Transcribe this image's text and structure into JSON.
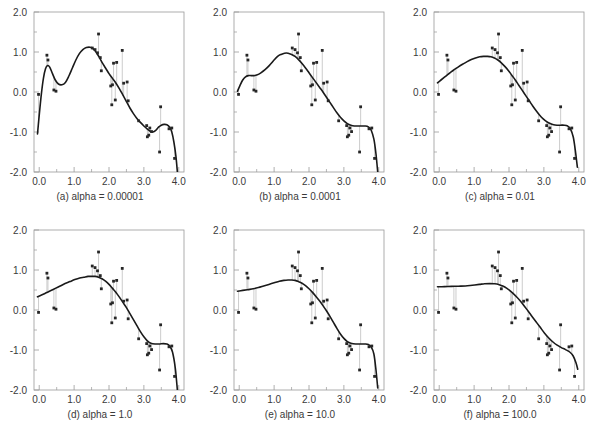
{
  "figure": {
    "type": "multi-panel-scatter-with-fitted-curve",
    "rows": 2,
    "cols": 3,
    "background": "#ffffff",
    "marker_color": "#262626",
    "curve_color": "#1a1a1a",
    "stem_color": "#bfbfbf",
    "axis_color": "#9a9a9a",
    "text_color": "#3a3a3a"
  },
  "axes": {
    "xlim": [
      -0.15,
      4.15
    ],
    "ylim": [
      -2.0,
      2.0
    ],
    "xticks": [
      0.0,
      1.0,
      2.0,
      3.0,
      4.0
    ],
    "xticklabels": [
      "0.0",
      "1.0",
      "2.0",
      "3.0",
      "4.0"
    ],
    "xminorticks": [
      0.5,
      1.5,
      2.5,
      3.5
    ],
    "yticks": [
      2.0,
      1.0,
      0.0,
      -1.0,
      -2.0
    ],
    "yticklabels": [
      "2.0",
      "1.0",
      "0.0",
      "-1.0",
      "-2.0"
    ],
    "yminorticks": [
      1.5,
      0.5,
      -0.5,
      -1.5
    ],
    "grid": false,
    "xlabel": "",
    "ylabel": ""
  },
  "chart_data": {
    "type": "scatter",
    "title": "",
    "xlabel": "",
    "ylabel": "",
    "xlim": [
      -0.15,
      4.15
    ],
    "ylim": [
      -2.0,
      2.0
    ],
    "grid": false,
    "legend": "none",
    "shared_scatter": {
      "name": "observations",
      "x": [
        -0.02,
        0.22,
        0.25,
        0.42,
        0.48,
        1.52,
        1.6,
        1.67,
        1.7,
        1.75,
        1.78,
        2.05,
        2.08,
        2.1,
        2.13,
        2.18,
        2.22,
        2.38,
        2.42,
        2.52,
        2.55,
        2.85,
        3.08,
        3.1,
        3.14,
        3.17,
        3.22,
        3.45,
        3.48,
        3.72,
        3.8,
        3.88
      ],
      "y": [
        -0.06,
        0.92,
        0.8,
        0.05,
        0.02,
        1.1,
        1.06,
        0.98,
        1.45,
        0.86,
        0.53,
        0.15,
        -0.32,
        0.18,
        0.72,
        -0.2,
        0.74,
        1.04,
        0.22,
        0.25,
        -0.22,
        -0.72,
        -0.84,
        -1.12,
        -1.08,
        -0.9,
        -0.99,
        -1.5,
        -0.37,
        -0.92,
        -0.9,
        -1.66
      ]
    },
    "panels": [
      {
        "id": "a",
        "label": "(a) alpha = 0.00001",
        "alpha": "0.00001",
        "series_name": "smoothing spline fit",
        "curve": {
          "x": [
            -0.05,
            0.0,
            0.06,
            0.12,
            0.18,
            0.24,
            0.3,
            0.38,
            0.46,
            0.55,
            0.65,
            0.75,
            0.85,
            0.95,
            1.05,
            1.15,
            1.25,
            1.35,
            1.45,
            1.52,
            1.6,
            1.7,
            1.8,
            1.9,
            2.0,
            2.1,
            2.2,
            2.3,
            2.4,
            2.5,
            2.6,
            2.7,
            2.8,
            2.9,
            3.0,
            3.1,
            3.18,
            3.26,
            3.34,
            3.42,
            3.5,
            3.58,
            3.66,
            3.74,
            3.8,
            3.86,
            3.92,
            3.96
          ],
          "y": [
            -1.05,
            -0.58,
            -0.06,
            0.34,
            0.58,
            0.66,
            0.62,
            0.46,
            0.3,
            0.2,
            0.18,
            0.24,
            0.4,
            0.6,
            0.8,
            0.96,
            1.06,
            1.11,
            1.12,
            1.1,
            1.03,
            0.9,
            0.74,
            0.6,
            0.46,
            0.34,
            0.22,
            0.08,
            -0.08,
            -0.24,
            -0.4,
            -0.54,
            -0.66,
            -0.76,
            -0.85,
            -0.93,
            -0.98,
            -1.0,
            -0.96,
            -0.88,
            -0.83,
            -0.81,
            -0.82,
            -0.88,
            -1.0,
            -1.25,
            -1.62,
            -2.0
          ]
        }
      },
      {
        "id": "b",
        "label": "(b) alpha = 0.0001",
        "alpha": "0.0001",
        "series_name": "smoothing spline fit",
        "curve": {
          "x": [
            -0.05,
            0.02,
            0.1,
            0.18,
            0.26,
            0.34,
            0.42,
            0.52,
            0.62,
            0.74,
            0.86,
            0.98,
            1.1,
            1.2,
            1.3,
            1.4,
            1.5,
            1.6,
            1.7,
            1.8,
            1.9,
            2.0,
            2.1,
            2.2,
            2.3,
            2.4,
            2.5,
            2.6,
            2.7,
            2.8,
            2.9,
            3.0,
            3.1,
            3.2,
            3.3,
            3.4,
            3.5,
            3.6,
            3.7,
            3.78,
            3.86,
            3.92,
            3.97
          ],
          "y": [
            0.02,
            0.16,
            0.3,
            0.38,
            0.41,
            0.41,
            0.41,
            0.43,
            0.48,
            0.56,
            0.66,
            0.78,
            0.89,
            0.94,
            0.97,
            0.97,
            0.94,
            0.89,
            0.81,
            0.71,
            0.6,
            0.48,
            0.36,
            0.24,
            0.12,
            0.0,
            -0.13,
            -0.26,
            -0.39,
            -0.52,
            -0.63,
            -0.72,
            -0.79,
            -0.83,
            -0.85,
            -0.85,
            -0.85,
            -0.85,
            -0.87,
            -0.95,
            -1.18,
            -1.55,
            -2.0
          ]
        }
      },
      {
        "id": "c",
        "label": "(c) alpha = 0.01",
        "alpha": "0.01",
        "series_name": "smoothing spline fit",
        "curve": {
          "x": [
            -0.05,
            0.05,
            0.15,
            0.25,
            0.35,
            0.45,
            0.55,
            0.68,
            0.8,
            0.92,
            1.04,
            1.16,
            1.28,
            1.38,
            1.48,
            1.58,
            1.68,
            1.78,
            1.88,
            1.98,
            2.08,
            2.18,
            2.28,
            2.38,
            2.48,
            2.58,
            2.68,
            2.78,
            2.88,
            2.98,
            3.08,
            3.18,
            3.28,
            3.38,
            3.48,
            3.58,
            3.68,
            3.76,
            3.84,
            3.9,
            3.96
          ],
          "y": [
            0.23,
            0.3,
            0.37,
            0.44,
            0.51,
            0.57,
            0.63,
            0.7,
            0.76,
            0.81,
            0.85,
            0.88,
            0.89,
            0.89,
            0.88,
            0.85,
            0.8,
            0.73,
            0.64,
            0.54,
            0.42,
            0.3,
            0.17,
            0.04,
            -0.09,
            -0.22,
            -0.35,
            -0.47,
            -0.58,
            -0.67,
            -0.74,
            -0.79,
            -0.82,
            -0.83,
            -0.83,
            -0.83,
            -0.85,
            -0.92,
            -1.12,
            -1.45,
            -1.88
          ]
        }
      },
      {
        "id": "d",
        "label": "(d) alpha = 1.0",
        "alpha": "1.0",
        "series_name": "smoothing spline fit",
        "curve": {
          "x": [
            -0.05,
            0.08,
            0.2,
            0.32,
            0.46,
            0.6,
            0.74,
            0.88,
            1.02,
            1.16,
            1.28,
            1.4,
            1.5,
            1.6,
            1.7,
            1.8,
            1.9,
            2.0,
            2.1,
            2.2,
            2.3,
            2.4,
            2.5,
            2.6,
            2.7,
            2.8,
            2.9,
            3.0,
            3.1,
            3.2,
            3.32,
            3.44,
            3.56,
            3.66,
            3.74,
            3.82,
            3.9,
            3.96
          ],
          "y": [
            0.33,
            0.38,
            0.43,
            0.48,
            0.54,
            0.6,
            0.66,
            0.71,
            0.76,
            0.8,
            0.82,
            0.84,
            0.84,
            0.84,
            0.82,
            0.78,
            0.72,
            0.64,
            0.54,
            0.44,
            0.32,
            0.19,
            0.06,
            -0.09,
            -0.24,
            -0.39,
            -0.54,
            -0.67,
            -0.77,
            -0.83,
            -0.85,
            -0.85,
            -0.84,
            -0.85,
            -0.9,
            -1.05,
            -1.45,
            -2.0
          ]
        }
      },
      {
        "id": "e",
        "label": "(e) alpha = 10.0",
        "alpha": "10.0",
        "series_name": "smoothing spline fit",
        "curve": {
          "x": [
            -0.05,
            0.1,
            0.25,
            0.4,
            0.55,
            0.7,
            0.85,
            1.0,
            1.15,
            1.28,
            1.4,
            1.5,
            1.6,
            1.7,
            1.8,
            1.9,
            2.0,
            2.1,
            2.2,
            2.3,
            2.4,
            2.5,
            2.6,
            2.7,
            2.8,
            2.9,
            3.0,
            3.1,
            3.2,
            3.34,
            3.48,
            3.6,
            3.7,
            3.78,
            3.86,
            3.92,
            3.97
          ],
          "y": [
            0.47,
            0.49,
            0.51,
            0.53,
            0.56,
            0.6,
            0.64,
            0.68,
            0.72,
            0.74,
            0.75,
            0.75,
            0.74,
            0.71,
            0.67,
            0.61,
            0.53,
            0.44,
            0.34,
            0.23,
            0.11,
            -0.02,
            -0.16,
            -0.31,
            -0.46,
            -0.6,
            -0.71,
            -0.79,
            -0.83,
            -0.85,
            -0.85,
            -0.85,
            -0.86,
            -0.92,
            -1.1,
            -1.5,
            -1.95
          ]
        }
      },
      {
        "id": "f",
        "label": "(f) alpha = 100.0",
        "alpha": "100.0",
        "series_name": "smoothing spline fit",
        "curve": {
          "x": [
            -0.05,
            0.15,
            0.35,
            0.55,
            0.75,
            0.95,
            1.15,
            1.3,
            1.45,
            1.58,
            1.7,
            1.82,
            1.94,
            2.06,
            2.18,
            2.3,
            2.42,
            2.54,
            2.66,
            2.78,
            2.9,
            3.02,
            3.14,
            3.26,
            3.38,
            3.5,
            3.62,
            3.74,
            3.84,
            3.92,
            3.97
          ],
          "y": [
            0.58,
            0.585,
            0.59,
            0.595,
            0.6,
            0.62,
            0.64,
            0.655,
            0.66,
            0.655,
            0.64,
            0.6,
            0.54,
            0.46,
            0.36,
            0.25,
            0.12,
            -0.02,
            -0.16,
            -0.3,
            -0.44,
            -0.58,
            -0.7,
            -0.8,
            -0.88,
            -0.94,
            -0.99,
            -1.05,
            -1.15,
            -1.32,
            -1.48
          ]
        }
      }
    ]
  }
}
